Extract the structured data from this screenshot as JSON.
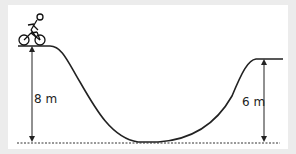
{
  "diagram": {
    "type": "roller-track-profile",
    "left_height_label": "8 m",
    "right_height_label": "6 m",
    "figure": "cyclist on bicycle at top of left hill",
    "baseline": "dotted ground reference line",
    "colors": {
      "background": "#ececec",
      "panel": "#ffffff",
      "line": "#222222"
    }
  }
}
